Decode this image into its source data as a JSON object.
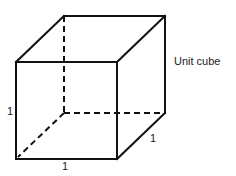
{
  "diagram": {
    "title": "Unit cube",
    "type": "cube-wireframe",
    "edge_labels": {
      "height": "1",
      "width": "1",
      "depth": "1"
    },
    "vertices": {
      "front_top_left": [
        16,
        62
      ],
      "front_top_right": [
        117,
        62
      ],
      "front_bottom_left": [
        16,
        159
      ],
      "front_bottom_right": [
        117,
        159
      ],
      "back_top_left": [
        64,
        16
      ],
      "back_top_right": [
        165,
        16
      ],
      "back_bottom_left": [
        64,
        113
      ],
      "back_bottom_right": [
        165,
        113
      ]
    },
    "hidden_edges": [
      "back_top_left-back_bottom_left",
      "back_bottom_left-back_bottom_right",
      "back_bottom_left-front_bottom_left"
    ],
    "colors": {
      "stroke": "#111111",
      "text": "#222222",
      "background": "#ffffff"
    }
  }
}
